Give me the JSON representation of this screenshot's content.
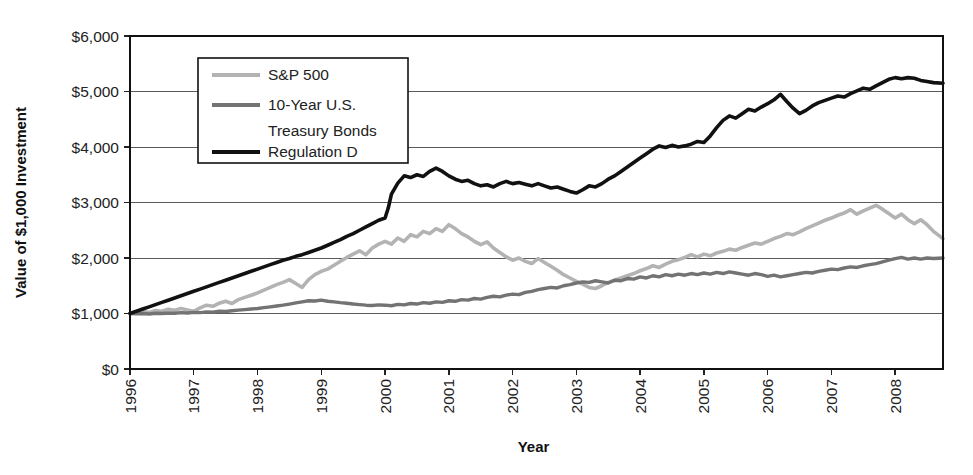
{
  "chart_data": {
    "type": "line",
    "title": "",
    "xlabel": "Year",
    "ylabel": "Value of $1,000 Investment",
    "xlim": [
      1996,
      2008.75
    ],
    "ylim": [
      0,
      6000
    ],
    "grid": true,
    "legend_position": "top-left-inside",
    "y_ticks": [
      0,
      1000,
      2000,
      3000,
      4000,
      5000,
      6000
    ],
    "y_tick_labels": [
      "$0",
      "$1,000",
      "$2,000",
      "$3,000",
      "$4,000",
      "$5,000",
      "$6,000"
    ],
    "x_ticks": [
      1996,
      1997,
      1998,
      1999,
      2000,
      2001,
      2002,
      2003,
      2004,
      2005,
      2006,
      2007,
      2008
    ],
    "x_tick_labels": [
      "1996",
      "1997",
      "1998",
      "1999",
      "2000",
      "2001",
      "2002",
      "2003",
      "2004",
      "2005",
      "2006",
      "2007",
      "2008"
    ],
    "colors": {
      "sp500": "#b3b3b3",
      "bonds": "#737373",
      "regulation_d": "#111111",
      "gridline": "#5a5a5a",
      "frame": "#111111",
      "background": "#ffffff"
    },
    "series": [
      {
        "name": "S&P 500",
        "color": "#b3b3b3",
        "stroke_width": 3.6,
        "x": [
          1996.0,
          1996.1,
          1996.2,
          1996.3,
          1996.4,
          1996.5,
          1996.6,
          1996.7,
          1996.8,
          1996.9,
          1997.0,
          1997.1,
          1997.2,
          1997.3,
          1997.4,
          1997.5,
          1997.6,
          1997.7,
          1997.8,
          1997.9,
          1998.0,
          1998.1,
          1998.2,
          1998.3,
          1998.4,
          1998.5,
          1998.6,
          1998.7,
          1998.8,
          1998.9,
          1999.0,
          1999.1,
          1999.2,
          1999.3,
          1999.4,
          1999.5,
          1999.6,
          1999.7,
          1999.8,
          1999.9,
          2000.0,
          2000.1,
          2000.2,
          2000.3,
          2000.4,
          2000.5,
          2000.6,
          2000.7,
          2000.8,
          2000.9,
          2001.0,
          2001.1,
          2001.2,
          2001.3,
          2001.4,
          2001.5,
          2001.6,
          2001.7,
          2001.8,
          2001.9,
          2002.0,
          2002.1,
          2002.2,
          2002.3,
          2002.4,
          2002.5,
          2002.6,
          2002.7,
          2002.8,
          2002.9,
          2003.0,
          2003.1,
          2003.2,
          2003.3,
          2003.4,
          2003.5,
          2003.6,
          2003.7,
          2003.8,
          2003.9,
          2004.0,
          2004.1,
          2004.2,
          2004.3,
          2004.4,
          2004.5,
          2004.6,
          2004.7,
          2004.8,
          2004.9,
          2005.0,
          2005.1,
          2005.2,
          2005.3,
          2005.4,
          2005.5,
          2005.6,
          2005.7,
          2005.8,
          2005.9,
          2006.0,
          2006.1,
          2006.2,
          2006.3,
          2006.4,
          2006.5,
          2006.6,
          2006.7,
          2006.8,
          2006.9,
          2007.0,
          2007.1,
          2007.2,
          2007.3,
          2007.4,
          2007.5,
          2007.6,
          2007.7,
          2007.8,
          2007.9,
          2008.0,
          2008.1,
          2008.2,
          2008.3,
          2008.4,
          2008.5,
          2008.6,
          2008.75
        ],
        "y": [
          1000,
          1010,
          1035,
          1020,
          1055,
          1040,
          1075,
          1060,
          1090,
          1065,
          1040,
          1100,
          1150,
          1130,
          1185,
          1220,
          1180,
          1250,
          1290,
          1330,
          1370,
          1420,
          1470,
          1520,
          1560,
          1610,
          1540,
          1470,
          1610,
          1700,
          1760,
          1800,
          1870,
          1940,
          2010,
          2070,
          2130,
          2060,
          2180,
          2250,
          2300,
          2250,
          2360,
          2300,
          2420,
          2380,
          2480,
          2440,
          2530,
          2480,
          2600,
          2530,
          2440,
          2380,
          2300,
          2240,
          2290,
          2180,
          2100,
          2020,
          1960,
          2000,
          1940,
          1900,
          1990,
          1920,
          1850,
          1780,
          1700,
          1640,
          1580,
          1530,
          1470,
          1450,
          1500,
          1560,
          1600,
          1640,
          1680,
          1720,
          1770,
          1810,
          1860,
          1830,
          1890,
          1940,
          1970,
          2010,
          2060,
          2020,
          2070,
          2040,
          2090,
          2120,
          2160,
          2140,
          2190,
          2230,
          2270,
          2250,
          2300,
          2350,
          2390,
          2440,
          2420,
          2470,
          2530,
          2580,
          2630,
          2680,
          2720,
          2770,
          2810,
          2870,
          2790,
          2850,
          2900,
          2950,
          2880,
          2800,
          2720,
          2790,
          2690,
          2620,
          2690,
          2600,
          2480,
          2350
        ]
      },
      {
        "name": "10-Year U.S. Treasury Bonds",
        "color": "#737373",
        "stroke_width": 3.4,
        "x": [
          1996.0,
          1996.1,
          1996.2,
          1996.3,
          1996.4,
          1996.5,
          1996.6,
          1996.7,
          1996.8,
          1996.9,
          1997.0,
          1997.1,
          1997.2,
          1997.3,
          1997.4,
          1997.5,
          1997.6,
          1997.7,
          1997.8,
          1997.9,
          1998.0,
          1998.1,
          1998.2,
          1998.3,
          1998.4,
          1998.5,
          1998.6,
          1998.7,
          1998.8,
          1998.9,
          1999.0,
          1999.1,
          1999.2,
          1999.3,
          1999.4,
          1999.5,
          1999.6,
          1999.7,
          1999.8,
          1999.9,
          2000.0,
          2000.1,
          2000.2,
          2000.3,
          2000.4,
          2000.5,
          2000.6,
          2000.7,
          2000.8,
          2000.9,
          2001.0,
          2001.1,
          2001.2,
          2001.3,
          2001.4,
          2001.5,
          2001.6,
          2001.7,
          2001.8,
          2001.9,
          2002.0,
          2002.1,
          2002.2,
          2002.3,
          2002.4,
          2002.5,
          2002.6,
          2002.7,
          2002.8,
          2002.9,
          2003.0,
          2003.1,
          2003.2,
          2003.3,
          2003.4,
          2003.5,
          2003.6,
          2003.7,
          2003.8,
          2003.9,
          2004.0,
          2004.1,
          2004.2,
          2004.3,
          2004.4,
          2004.5,
          2004.6,
          2004.7,
          2004.8,
          2004.9,
          2005.0,
          2005.1,
          2005.2,
          2005.3,
          2005.4,
          2005.5,
          2005.6,
          2005.7,
          2005.8,
          2005.9,
          2006.0,
          2006.1,
          2006.2,
          2006.3,
          2006.4,
          2006.5,
          2006.6,
          2006.7,
          2006.8,
          2006.9,
          2007.0,
          2007.1,
          2007.2,
          2007.3,
          2007.4,
          2007.5,
          2007.6,
          2007.7,
          2007.8,
          2007.9,
          2008.0,
          2008.1,
          2008.2,
          2008.3,
          2008.4,
          2008.5,
          2008.6,
          2008.75
        ],
        "y": [
          1000,
          995,
          1000,
          990,
          1005,
          1000,
          1010,
          1005,
          1015,
          1010,
          1020,
          1015,
          1030,
          1025,
          1040,
          1035,
          1050,
          1060,
          1070,
          1080,
          1090,
          1105,
          1120,
          1135,
          1150,
          1170,
          1190,
          1210,
          1230,
          1225,
          1240,
          1220,
          1210,
          1195,
          1185,
          1170,
          1160,
          1150,
          1145,
          1155,
          1150,
          1140,
          1165,
          1155,
          1180,
          1170,
          1195,
          1185,
          1210,
          1200,
          1230,
          1220,
          1250,
          1240,
          1270,
          1260,
          1290,
          1310,
          1300,
          1330,
          1350,
          1340,
          1380,
          1400,
          1430,
          1450,
          1470,
          1460,
          1500,
          1520,
          1550,
          1570,
          1560,
          1590,
          1570,
          1550,
          1600,
          1590,
          1630,
          1620,
          1660,
          1640,
          1680,
          1660,
          1700,
          1680,
          1710,
          1690,
          1720,
          1700,
          1730,
          1710,
          1740,
          1720,
          1750,
          1730,
          1710,
          1690,
          1720,
          1700,
          1670,
          1690,
          1660,
          1680,
          1700,
          1720,
          1740,
          1730,
          1760,
          1780,
          1800,
          1790,
          1820,
          1840,
          1830,
          1860,
          1880,
          1900,
          1930,
          1960,
          1990,
          2010,
          1980,
          2000,
          1980,
          2000,
          1990,
          2000
        ]
      },
      {
        "name": "Regulation D",
        "color": "#111111",
        "stroke_width": 3.6,
        "x": [
          1996.0,
          1996.1,
          1996.2,
          1996.3,
          1996.4,
          1996.5,
          1996.6,
          1996.7,
          1996.8,
          1996.9,
          1997.0,
          1997.1,
          1997.2,
          1997.3,
          1997.4,
          1997.5,
          1997.6,
          1997.7,
          1997.8,
          1997.9,
          1998.0,
          1998.1,
          1998.2,
          1998.3,
          1998.4,
          1998.5,
          1998.6,
          1998.7,
          1998.8,
          1998.9,
          1999.0,
          1999.1,
          1999.2,
          1999.3,
          1999.4,
          1999.5,
          1999.6,
          1999.7,
          1999.8,
          1999.9,
          2000.0,
          2000.05,
          2000.1,
          2000.2,
          2000.3,
          2000.4,
          2000.5,
          2000.6,
          2000.7,
          2000.8,
          2000.9,
          2001.0,
          2001.1,
          2001.2,
          2001.3,
          2001.4,
          2001.5,
          2001.6,
          2001.7,
          2001.8,
          2001.9,
          2002.0,
          2002.1,
          2002.2,
          2002.3,
          2002.4,
          2002.5,
          2002.6,
          2002.7,
          2002.8,
          2002.9,
          2003.0,
          2003.1,
          2003.2,
          2003.3,
          2003.4,
          2003.5,
          2003.6,
          2003.7,
          2003.8,
          2003.9,
          2004.0,
          2004.1,
          2004.2,
          2004.3,
          2004.4,
          2004.5,
          2004.6,
          2004.7,
          2004.8,
          2004.9,
          2005.0,
          2005.1,
          2005.2,
          2005.3,
          2005.4,
          2005.5,
          2005.6,
          2005.7,
          2005.8,
          2005.9,
          2006.0,
          2006.1,
          2006.2,
          2006.3,
          2006.4,
          2006.5,
          2006.6,
          2006.7,
          2006.8,
          2006.9,
          2007.0,
          2007.1,
          2007.2,
          2007.3,
          2007.4,
          2007.5,
          2007.6,
          2007.7,
          2007.8,
          2007.9,
          2008.0,
          2008.1,
          2008.2,
          2008.3,
          2008.4,
          2008.5,
          2008.6,
          2008.75
        ],
        "y": [
          1000,
          1040,
          1080,
          1120,
          1160,
          1200,
          1240,
          1280,
          1320,
          1360,
          1400,
          1440,
          1480,
          1520,
          1560,
          1600,
          1640,
          1680,
          1720,
          1760,
          1800,
          1840,
          1880,
          1920,
          1960,
          1990,
          2030,
          2060,
          2100,
          2140,
          2180,
          2230,
          2280,
          2330,
          2390,
          2440,
          2500,
          2560,
          2620,
          2680,
          2720,
          2900,
          3150,
          3350,
          3480,
          3450,
          3500,
          3470,
          3560,
          3620,
          3560,
          3480,
          3420,
          3380,
          3400,
          3340,
          3300,
          3320,
          3280,
          3340,
          3380,
          3340,
          3360,
          3330,
          3300,
          3340,
          3300,
          3260,
          3280,
          3240,
          3200,
          3170,
          3230,
          3300,
          3280,
          3340,
          3420,
          3480,
          3560,
          3640,
          3720,
          3800,
          3880,
          3960,
          4020,
          3990,
          4030,
          4000,
          4020,
          4050,
          4100,
          4080,
          4200,
          4350,
          4480,
          4560,
          4520,
          4600,
          4680,
          4650,
          4720,
          4780,
          4850,
          4950,
          4820,
          4700,
          4600,
          4660,
          4740,
          4800,
          4840,
          4880,
          4920,
          4900,
          4960,
          5010,
          5060,
          5040,
          5100,
          5160,
          5220,
          5250,
          5230,
          5250,
          5240,
          5200,
          5180,
          5160,
          5150
        ]
      }
    ]
  },
  "legend": {
    "entries": [
      {
        "label": "S&P 500",
        "color": "#b3b3b3"
      },
      {
        "label": "10-Year U.S.",
        "color": "#737373"
      },
      {
        "label": "Treasury Bonds",
        "color": null
      },
      {
        "label": "Regulation D",
        "color": "#111111"
      }
    ]
  },
  "axes": {
    "y_title": "Value of $1,000 Investment",
    "x_title": "Year"
  }
}
